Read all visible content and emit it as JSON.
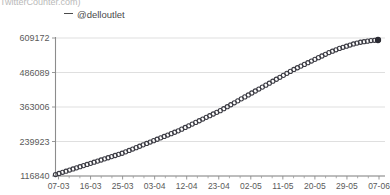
{
  "watermark": "TwitterCounter.com)",
  "legend": {
    "label": "@delloutlet",
    "marker": "dash-marker",
    "color": "#4a4a4a"
  },
  "chart_data": {
    "type": "scatter",
    "title": "",
    "subtitle": "",
    "xlabel": "",
    "ylabel": "",
    "legend_position": "top-left",
    "grid": true,
    "series_name": "@delloutlet",
    "ylim": [
      116840,
      609172
    ],
    "yticks": [
      116840,
      239923,
      363006,
      486089,
      609172
    ],
    "ytick_labels": [
      "116840",
      "239923",
      "363006",
      "486089",
      "609172"
    ],
    "xtick_labels": [
      "07-03",
      "16-03",
      "25-03",
      "03-04",
      "12-04",
      "23-04",
      "02-05",
      "11-05",
      "20-05",
      "29-05",
      "07-06"
    ],
    "x": [
      "07-03",
      "08-03",
      "09-03",
      "10-03",
      "11-03",
      "12-03",
      "13-03",
      "14-03",
      "15-03",
      "16-03",
      "17-03",
      "18-03",
      "19-03",
      "20-03",
      "21-03",
      "22-03",
      "23-03",
      "24-03",
      "25-03",
      "26-03",
      "27-03",
      "28-03",
      "29-03",
      "30-03",
      "31-03",
      "01-04",
      "02-04",
      "03-04",
      "04-04",
      "05-04",
      "06-04",
      "07-04",
      "08-04",
      "09-04",
      "10-04",
      "11-04",
      "12-04",
      "13-04",
      "14-04",
      "15-04",
      "16-04",
      "17-04",
      "18-04",
      "19-04",
      "20-04",
      "21-04",
      "22-04",
      "23-04",
      "24-04",
      "25-04",
      "26-04",
      "27-04",
      "28-04",
      "29-04",
      "30-04",
      "01-05",
      "02-05",
      "03-05",
      "04-05",
      "05-05",
      "06-05",
      "07-05",
      "08-05",
      "09-05",
      "10-05",
      "11-05",
      "12-05",
      "13-05",
      "14-05",
      "15-05",
      "16-05",
      "17-05",
      "18-05",
      "19-05",
      "20-05",
      "21-05",
      "22-05",
      "23-05",
      "24-05",
      "25-05",
      "26-05",
      "27-05",
      "28-05",
      "29-05",
      "30-05",
      "31-05",
      "01-06",
      "02-06",
      "03-06",
      "04-06",
      "05-06",
      "06-06",
      "07-06"
    ],
    "values": [
      122000,
      126000,
      130000,
      134000,
      138000,
      142000,
      146000,
      150000,
      154000,
      158000,
      162000,
      166000,
      170000,
      174000,
      178000,
      182000,
      186000,
      190000,
      194000,
      198000,
      203000,
      208000,
      213000,
      218000,
      223000,
      228000,
      233000,
      238000,
      243000,
      248000,
      253000,
      258000,
      263000,
      268000,
      273000,
      278000,
      284000,
      290000,
      296000,
      302000,
      308000,
      314000,
      320000,
      326000,
      332000,
      338000,
      344000,
      350000,
      357000,
      364000,
      371000,
      378000,
      385000,
      392000,
      399000,
      406000,
      413000,
      420000,
      427000,
      434000,
      441000,
      448000,
      455000,
      462000,
      469000,
      476000,
      483000,
      490000,
      497000,
      503000,
      509000,
      515000,
      521000,
      527000,
      533000,
      539000,
      545000,
      551000,
      557000,
      562000,
      567000,
      572000,
      576000,
      580000,
      584000,
      588000,
      591000,
      594000,
      596000,
      598000,
      600000,
      601000,
      602000
    ]
  }
}
